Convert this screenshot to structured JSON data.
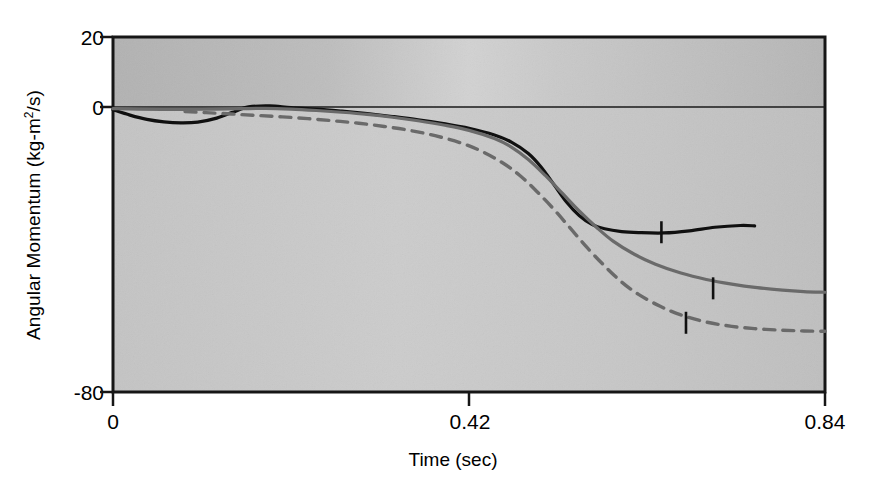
{
  "chart_data": {
    "type": "line",
    "title": "",
    "xlabel": "Time (sec)",
    "ylabel": "Angular Momentum (kg-m2/s)",
    "ylabel_base": "Angular Momentum (kg-m",
    "ylabel_sup": "2",
    "ylabel_tail": "/s)",
    "xlim": [
      0,
      0.84
    ],
    "ylim": [
      -80,
      20
    ],
    "xticks": [
      0,
      0.42,
      0.84
    ],
    "xtick_labels": [
      "0",
      "0.42",
      "0.84"
    ],
    "yticks": [
      20,
      0,
      -80
    ],
    "ytick_labels": [
      "20",
      "0",
      "-80"
    ],
    "grid": false,
    "legend": "inline-curve-labels",
    "zero_line": true,
    "plot_bg": "#c6c6c6",
    "plot_bg_top": "#b9b9b9",
    "frame_color": "#161616",
    "series": [
      {
        "name": "1/2",
        "label": "1/2",
        "color": "#101010",
        "style": "solid",
        "width": 3.2,
        "label_pos": {
          "x": 0.595,
          "y": -29.5
        },
        "tick_mark": {
          "x": 0.647,
          "y": -35.0
        },
        "x": [
          0.0,
          0.02,
          0.04,
          0.06,
          0.08,
          0.1,
          0.12,
          0.14,
          0.16,
          0.185,
          0.21,
          0.24,
          0.27,
          0.3,
          0.33,
          0.36,
          0.39,
          0.42,
          0.45,
          0.47,
          0.49,
          0.505,
          0.52,
          0.535,
          0.55,
          0.565,
          0.58,
          0.6,
          0.62,
          0.65,
          0.68,
          0.71,
          0.74,
          0.757
        ],
        "y": [
          -0.5,
          -2.0,
          -3.2,
          -3.9,
          -4.2,
          -4.0,
          -3.0,
          -1.3,
          0.3,
          0.6,
          0.1,
          -0.3,
          -0.9,
          -1.6,
          -2.4,
          -3.3,
          -4.4,
          -5.7,
          -7.6,
          -9.6,
          -12.8,
          -16.6,
          -21.5,
          -26.5,
          -30.3,
          -32.8,
          -34.0,
          -34.8,
          -35.1,
          -35.2,
          -34.6,
          -33.6,
          -33.1,
          -33.2
        ]
      },
      {
        "name": "1",
        "label": "1",
        "color": "#6a6a6a",
        "style": "solid",
        "width": 3.2,
        "label_pos": {
          "x": 0.635,
          "y": -39.5
        },
        "tick_mark": {
          "x": 0.708,
          "y": -50.8
        },
        "x": [
          0.0,
          0.03,
          0.06,
          0.09,
          0.12,
          0.15,
          0.18,
          0.21,
          0.24,
          0.27,
          0.3,
          0.33,
          0.36,
          0.39,
          0.42,
          0.45,
          0.47,
          0.49,
          0.51,
          0.53,
          0.55,
          0.57,
          0.59,
          0.615,
          0.64,
          0.67,
          0.7,
          0.73,
          0.76,
          0.79,
          0.815,
          0.84
        ],
        "y": [
          -0.2,
          -0.3,
          -0.4,
          -0.4,
          -0.3,
          -0.2,
          -0.1,
          -0.3,
          -0.7,
          -1.2,
          -1.8,
          -2.6,
          -3.6,
          -4.8,
          -6.3,
          -8.6,
          -11.0,
          -14.5,
          -19.0,
          -24.0,
          -29.0,
          -33.5,
          -37.5,
          -41.2,
          -44.0,
          -46.5,
          -48.3,
          -49.6,
          -50.6,
          -51.3,
          -51.7,
          -51.9
        ]
      },
      {
        "name": "2",
        "label": "2",
        "color": "#6a6a6a",
        "style": "dashed",
        "width": 3.4,
        "dash": "11 8",
        "label_pos": {
          "x": 0.625,
          "y": -51.0
        },
        "tick_mark": {
          "x": 0.676,
          "y": -60.5
        },
        "x": [
          0.085,
          0.11,
          0.14,
          0.17,
          0.2,
          0.23,
          0.26,
          0.29,
          0.32,
          0.35,
          0.38,
          0.41,
          0.435,
          0.46,
          0.48,
          0.5,
          0.52,
          0.54,
          0.56,
          0.58,
          0.6,
          0.62,
          0.645,
          0.67,
          0.7,
          0.73,
          0.76,
          0.79,
          0.815,
          0.84
        ],
        "y": [
          -1.0,
          -1.3,
          -1.7,
          -2.1,
          -2.5,
          -3.0,
          -3.6,
          -4.3,
          -5.2,
          -6.3,
          -7.8,
          -9.8,
          -12.2,
          -15.5,
          -19.0,
          -23.5,
          -28.5,
          -34.0,
          -39.5,
          -44.5,
          -49.0,
          -52.5,
          -55.8,
          -58.3,
          -60.3,
          -61.5,
          -62.2,
          -62.6,
          -62.8,
          -62.9
        ]
      }
    ]
  },
  "axes": {
    "y_title": "Angular Momentum (kg-m",
    "y_title_sup": "2",
    "y_title_end": "/s)",
    "x_title": "Time (sec)"
  }
}
